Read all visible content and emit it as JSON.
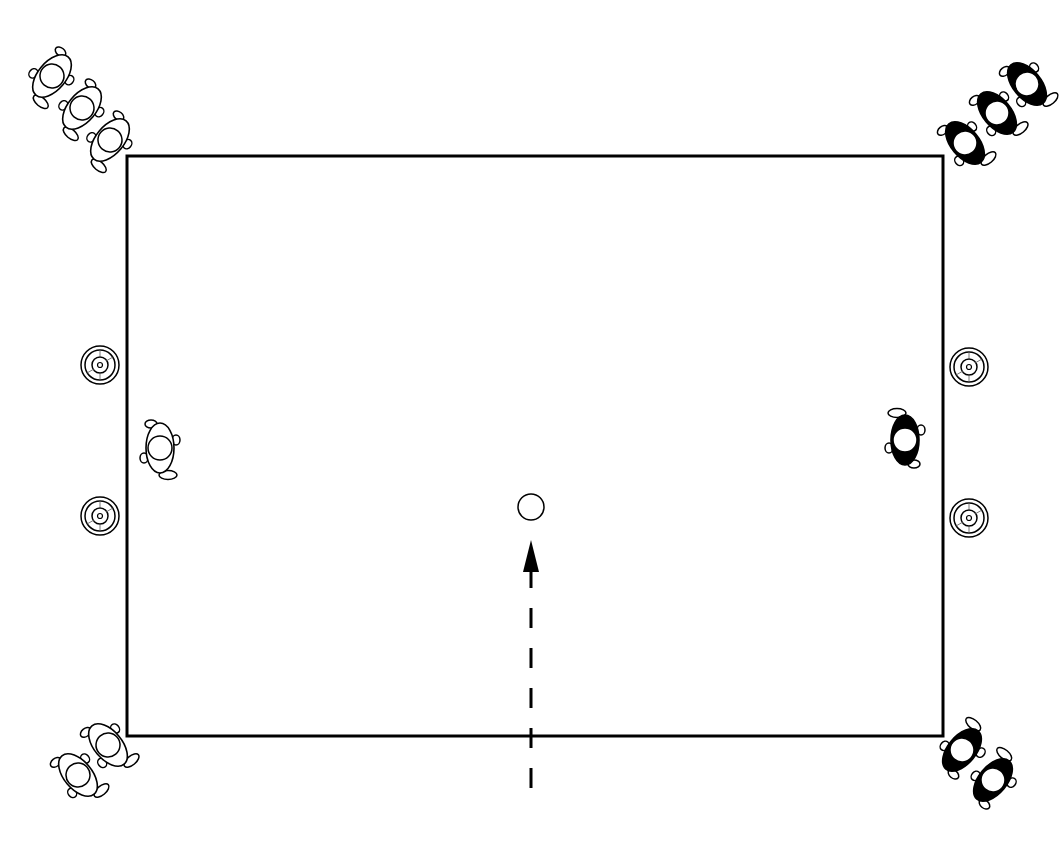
{
  "diagram": {
    "type": "drill-diagram",
    "colors": {
      "background": "#ffffff",
      "line": "#000000",
      "team_a": "#ffffff",
      "team_b": "#000000"
    },
    "field": {
      "x": 127,
      "y": 156,
      "width": 816,
      "height": 580
    },
    "teams": {
      "white": {
        "label": "White team",
        "players": [
          {
            "id": "w1",
            "x": 52,
            "y": 76,
            "rotation": 40
          },
          {
            "id": "w2",
            "x": 82,
            "y": 108,
            "rotation": 40
          },
          {
            "id": "w3",
            "x": 110,
            "y": 140,
            "rotation": 40
          },
          {
            "id": "w4",
            "x": 160,
            "y": 448,
            "rotation": 0
          },
          {
            "id": "w5",
            "x": 108,
            "y": 745,
            "rotation": -40
          },
          {
            "id": "w6",
            "x": 78,
            "y": 775,
            "rotation": -40
          }
        ]
      },
      "black": {
        "label": "Black team",
        "players": [
          {
            "id": "b1",
            "x": 1027,
            "y": 84,
            "rotation": -40
          },
          {
            "id": "b2",
            "x": 997,
            "y": 113,
            "rotation": -40
          },
          {
            "id": "b3",
            "x": 965,
            "y": 143,
            "rotation": -40
          },
          {
            "id": "b4",
            "x": 905,
            "y": 440,
            "rotation": 180
          },
          {
            "id": "b5",
            "x": 962,
            "y": 750,
            "rotation": 220
          },
          {
            "id": "b6",
            "x": 993,
            "y": 780,
            "rotation": 220
          }
        ]
      }
    },
    "targets": [
      {
        "id": "t1",
        "x": 100,
        "y": 365
      },
      {
        "id": "t2",
        "x": 100,
        "y": 516
      },
      {
        "id": "t3",
        "x": 969,
        "y": 367
      },
      {
        "id": "t4",
        "x": 969,
        "y": 518
      }
    ],
    "ball": {
      "x": 531,
      "y": 507,
      "r": 13
    },
    "arrow": {
      "x": 531,
      "y_start": 788,
      "y_end": 540,
      "style": "dashed"
    }
  }
}
